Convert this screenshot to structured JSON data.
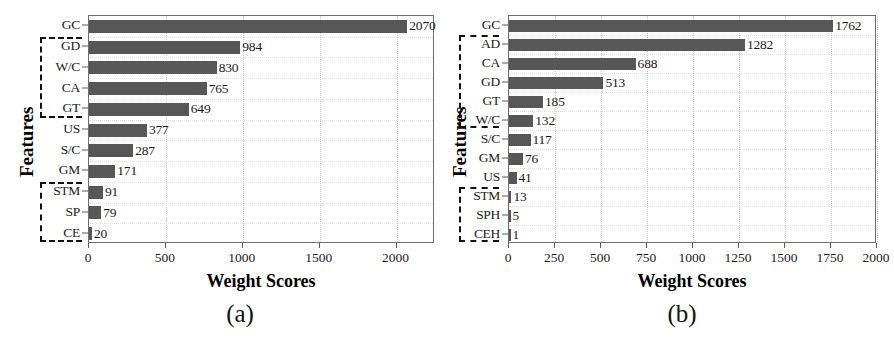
{
  "figure": {
    "subcaption_a": "(a)",
    "subcaption_b": "(b)"
  },
  "chart_data": [
    {
      "panel": "a",
      "type": "bar",
      "orientation": "horizontal",
      "title": "",
      "xlabel": "Weight Scores",
      "ylabel": "Features",
      "xlim": [
        0,
        2250
      ],
      "xticks": [
        0,
        500,
        1000,
        1500,
        2000
      ],
      "xtick_labels": [
        "0",
        "500",
        "1000",
        "1500",
        "2000"
      ],
      "grid": true,
      "legend": "none",
      "bar_color": "#575757",
      "categories": [
        "GC",
        "GD",
        "W/C",
        "CA",
        "GT",
        "US",
        "S/C",
        "GM",
        "STM",
        "SP",
        "CE"
      ],
      "values": [
        2070,
        984,
        830,
        765,
        649,
        377,
        287,
        171,
        91,
        79,
        20
      ],
      "value_labels": [
        "2070",
        "984",
        "830",
        "765",
        "649",
        "377",
        "287",
        "171",
        "91",
        "79",
        "20"
      ],
      "groups": [
        {
          "name": "group-top",
          "from": "GD",
          "to": "GT"
        },
        {
          "name": "group-bottom",
          "from": "STM",
          "to": "CE"
        }
      ]
    },
    {
      "panel": "b",
      "type": "bar",
      "orientation": "horizontal",
      "title": "",
      "xlabel": "Weight Scores",
      "ylabel": "Features",
      "xlim": [
        0,
        2000
      ],
      "xticks": [
        0,
        250,
        500,
        750,
        1000,
        1250,
        1500,
        1750,
        2000
      ],
      "xtick_labels": [
        "0",
        "250",
        "500",
        "750",
        "1000",
        "1250",
        "1500",
        "1750",
        "2000"
      ],
      "grid": true,
      "legend": "none",
      "bar_color": "#575757",
      "categories": [
        "GC",
        "AD",
        "CA",
        "GD",
        "GT",
        "W/C",
        "S/C",
        "GM",
        "US",
        "STM",
        "SPH",
        "CEH"
      ],
      "values": [
        1762,
        1282,
        688,
        513,
        185,
        132,
        117,
        76,
        41,
        13,
        5,
        1
      ],
      "value_labels": [
        "1762",
        "1282",
        "688",
        "513",
        "185",
        "132",
        "117",
        "76",
        "41",
        "13",
        "5",
        "1"
      ],
      "groups": [
        {
          "name": "group-top",
          "from": "AD",
          "to": "W/C"
        },
        {
          "name": "group-bottom",
          "from": "STM",
          "to": "CEH"
        }
      ]
    }
  ]
}
